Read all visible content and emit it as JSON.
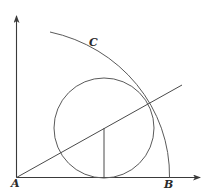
{
  "diagram": {
    "labels": {
      "origin": "A",
      "x_axis_point": "B",
      "arc": "C"
    },
    "stroke_color": "#5a5a5a",
    "axis_color": "#3a3a3a",
    "background": "#ffffff",
    "elements": [
      {
        "type": "axis",
        "name": "x-axis",
        "from": [
          16.5,
          177.5
        ],
        "to": [
          200,
          177.5
        ],
        "arrow": true
      },
      {
        "type": "axis",
        "name": "y-axis",
        "from": [
          16.5,
          177.5
        ],
        "to": [
          16.5,
          16
        ],
        "arrow": true
      },
      {
        "type": "arc",
        "name": "quarter-arc-C",
        "center": [
          16.5,
          177.5
        ],
        "from": [
          50,
          32
        ],
        "to": [
          169.5,
          177.5
        ]
      },
      {
        "type": "circle",
        "name": "inscribed-circle",
        "center": [
          104,
          128
        ],
        "radius": 50
      },
      {
        "type": "line",
        "name": "ray-from-A",
        "from": [
          16.5,
          177.5
        ],
        "to": [
          182,
          85
        ]
      },
      {
        "type": "segment",
        "name": "vertical-radius",
        "from": [
          104,
          128
        ],
        "to": [
          104,
          177.5
        ]
      }
    ]
  }
}
